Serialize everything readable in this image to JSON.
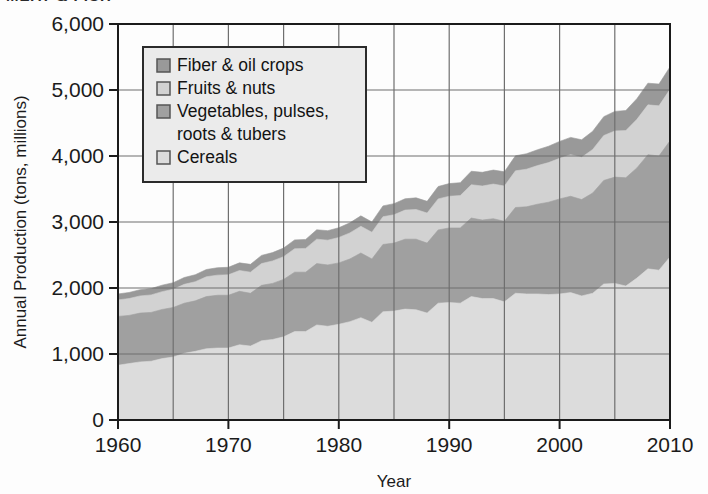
{
  "figure": {
    "cropped_header_fragment": "MEAT & FISH",
    "background": "#fdfdfd"
  },
  "colors": {
    "cereals": "#dcdcdc",
    "vegetables_pulses_roots_tubers": "#a0a0a0",
    "fruits_nuts": "#d2d2d2",
    "fiber_oil_crops": "#999999",
    "axis": "#1b1b1b",
    "grid": "#6f6f6f",
    "legend_bg": "#ebebeb",
    "legend_border": "#2b2b2b"
  },
  "axes": {
    "y_title": "Annual Production (tons, millions)",
    "x_title": "Year",
    "y_ticks": [
      "0",
      "1,000",
      "2,000",
      "3,000",
      "4,000",
      "5,000",
      "6,000"
    ],
    "x_ticks": [
      "1960",
      "1970",
      "1980",
      "1990",
      "2000",
      "2010"
    ]
  },
  "legend": {
    "items": [
      {
        "label": "Fiber & oil crops",
        "swatch": "#999999",
        "swatch_name": "legend-swatch-fiber-oil-crops"
      },
      {
        "label": "Fruits & nuts",
        "swatch": "#d2d2d2",
        "swatch_name": "legend-swatch-fruits-nuts"
      },
      {
        "label": "Vegetables, pulses,",
        "label2": "roots & tubers",
        "swatch": "#a0a0a0",
        "swatch_name": "legend-swatch-vegetables"
      },
      {
        "label": "Cereals",
        "swatch": "#dcdcdc",
        "swatch_name": "legend-swatch-cereals"
      }
    ]
  },
  "chart_data": {
    "type": "area",
    "stacked": true,
    "title": "",
    "xlabel": "Year",
    "ylabel": "Annual Production (tons, millions)",
    "xlim": [
      1960,
      2010
    ],
    "ylim": [
      0,
      6000
    ],
    "ytick_values": [
      0,
      1000,
      2000,
      3000,
      4000,
      5000,
      6000
    ],
    "xtick_values": [
      1960,
      1970,
      1980,
      1990,
      2000,
      2010
    ],
    "grid": true,
    "grid_spacing_x": 5,
    "grid_spacing_y": 1000,
    "legend_position": "upper-left-inside",
    "x": [
      1960,
      1961,
      1962,
      1963,
      1964,
      1965,
      1966,
      1967,
      1968,
      1969,
      1970,
      1971,
      1972,
      1973,
      1974,
      1975,
      1976,
      1977,
      1978,
      1979,
      1980,
      1981,
      1982,
      1983,
      1984,
      1985,
      1986,
      1987,
      1988,
      1989,
      1990,
      1991,
      1992,
      1993,
      1994,
      1995,
      1996,
      1997,
      1998,
      1999,
      2000,
      2001,
      2002,
      2003,
      2004,
      2005,
      2006,
      2007,
      2008,
      2009,
      2010
    ],
    "series": [
      {
        "name": "Cereals",
        "color": "#dcdcdc",
        "values": [
          830,
          855,
          880,
          890,
          930,
          955,
          1010,
          1040,
          1080,
          1090,
          1090,
          1140,
          1120,
          1200,
          1220,
          1260,
          1340,
          1340,
          1440,
          1420,
          1450,
          1490,
          1550,
          1480,
          1640,
          1650,
          1680,
          1670,
          1620,
          1770,
          1780,
          1770,
          1870,
          1840,
          1840,
          1790,
          1920,
          1910,
          1910,
          1900,
          1910,
          1930,
          1880,
          1920,
          2060,
          2070,
          2030,
          2150,
          2290,
          2270,
          2470
        ]
      },
      {
        "name": "Vegetables, pulses, roots & tubers",
        "color": "#a0a0a0",
        "values": [
          740,
          730,
          740,
          740,
          745,
          750,
          760,
          765,
          790,
          800,
          800,
          810,
          800,
          840,
          850,
          870,
          900,
          900,
          930,
          930,
          930,
          950,
          980,
          960,
          1020,
          1030,
          1060,
          1070,
          1060,
          1110,
          1130,
          1140,
          1190,
          1190,
          1210,
          1220,
          1300,
          1320,
          1360,
          1400,
          1440,
          1460,
          1460,
          1520,
          1570,
          1610,
          1640,
          1670,
          1730,
          1730,
          1760
        ]
      },
      {
        "name": "Fruits & nuts",
        "color": "#d2d2d2",
        "values": [
          250,
          255,
          260,
          265,
          270,
          275,
          285,
          290,
          300,
          305,
          310,
          315,
          320,
          330,
          340,
          345,
          355,
          360,
          370,
          375,
          385,
          395,
          405,
          405,
          420,
          430,
          440,
          450,
          455,
          470,
          480,
          490,
          505,
          515,
          525,
          535,
          555,
          570,
          585,
          600,
          615,
          630,
          640,
          660,
          680,
          700,
          715,
          735,
          755,
          760,
          780
        ]
      },
      {
        "name": "Fiber & oil crops",
        "color": "#999999",
        "values": [
          90,
          92,
          94,
          96,
          98,
          100,
          104,
          106,
          110,
          112,
          114,
          116,
          118,
          124,
          126,
          130,
          134,
          136,
          142,
          144,
          148,
          152,
          158,
          156,
          164,
          168,
          172,
          176,
          178,
          188,
          192,
          196,
          204,
          208,
          212,
          216,
          228,
          234,
          240,
          248,
          256,
          262,
          266,
          276,
          286,
          296,
          304,
          314,
          328,
          330,
          340
        ]
      }
    ]
  }
}
